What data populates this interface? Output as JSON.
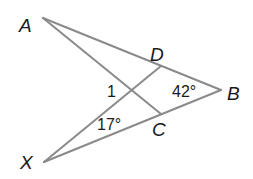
{
  "diagram": {
    "type": "geometry",
    "points": {
      "A": {
        "label": "A",
        "x": 43,
        "y": 18
      },
      "B": {
        "label": "B",
        "x": 221,
        "y": 90
      },
      "C": {
        "label": "C",
        "x": 161,
        "y": 114
      },
      "D": {
        "label": "D",
        "x": 161,
        "y": 66
      },
      "X": {
        "label": "X",
        "x": 44,
        "y": 162
      }
    },
    "segments": [
      {
        "from": "A",
        "to": "B"
      },
      {
        "from": "A",
        "to": "C"
      },
      {
        "from": "X",
        "to": "B"
      },
      {
        "from": "X",
        "to": "D"
      }
    ],
    "angles": {
      "angle_1": "1",
      "angle_B": "42°",
      "angle_X": "17°"
    },
    "line_color": "#8a8a8a"
  }
}
